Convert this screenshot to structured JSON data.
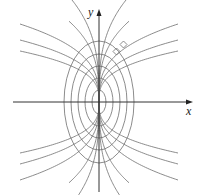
{
  "figure": {
    "title": "",
    "x_axis_label": "x",
    "y_axis_label": "y",
    "colors": {
      "curve": "#6e6e6e",
      "axis": "#333333",
      "background": "#ffffff"
    },
    "origin_px": [
      99,
      102
    ],
    "ellipses": {
      "description": "Concentric ellipses centered at origin (vertical major axis)",
      "semi_axes_px": [
        [
          7,
          12
        ],
        [
          14,
          24
        ],
        [
          21,
          36
        ],
        [
          28,
          48
        ],
        [
          35,
          61
        ]
      ]
    },
    "orthogonal_curves": {
      "description": "Family of curves through origin orthogonal to ellipses, y = C*|x|^(1/3), in all four quadrants",
      "exponent": 0.3333,
      "long_curves_end_dy_px_at_dx_79": [
        78,
        62,
        51
      ],
      "short_curves_C": [
        26,
        34
      ],
      "x_extent_px": 79
    },
    "right_angle_markers_px": [
      [
        113,
        55
      ],
      [
        120,
        48
      ]
    ]
  }
}
